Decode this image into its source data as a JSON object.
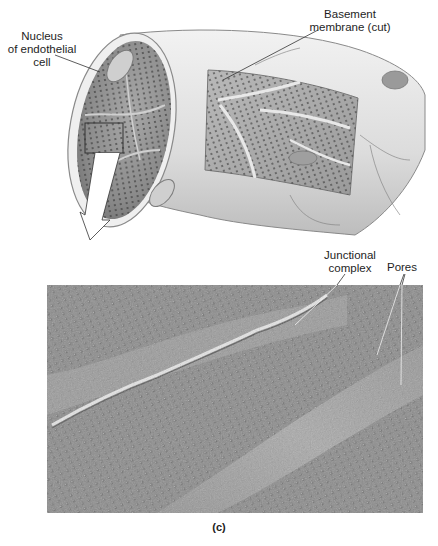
{
  "figure": {
    "panel_label": "(c)",
    "illustration": {
      "subject": "fenestrated capillary, cut-away view",
      "labels": {
        "nucleus": [
          "Nucleus",
          "of endothelial",
          "cell"
        ],
        "basement": [
          "Basement",
          "membrane (cut)"
        ]
      }
    },
    "micrograph": {
      "subject": "endothelial surface, scanning electron micrograph",
      "labels": {
        "junctional": [
          "Junctional",
          "complex"
        ],
        "pores": "Pores"
      }
    }
  },
  "colors": {
    "background": "#ffffff",
    "vessel_outer": "#e2e2e2",
    "vessel_inner": "#8f8f8f",
    "micrograph_base": "#8a8a8a",
    "label_text": "#1e1e1e",
    "leader_line": "#333333"
  }
}
